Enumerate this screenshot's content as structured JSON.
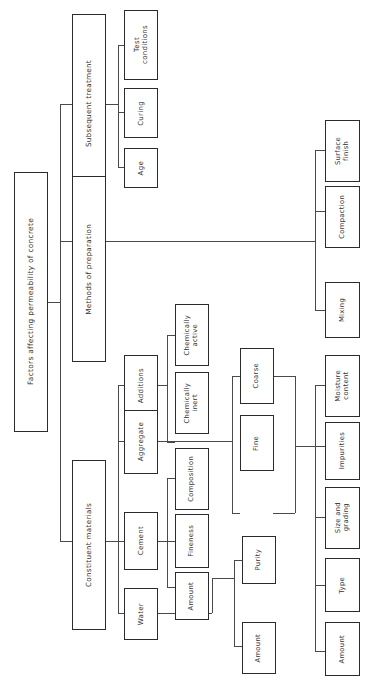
{
  "diagram": {
    "title": "Factors affecting permeability of concrete",
    "orientation": "rotated-90",
    "type": "tree-hierarchy-chart",
    "root": {
      "label": "Factors affecting permeability of concrete"
    },
    "level1": [
      {
        "id": "subsequent-treatment",
        "label": "Subsequent treatment"
      },
      {
        "id": "methods-of-preparation",
        "label": "Methods of preparation"
      },
      {
        "id": "constituent-materials",
        "label": "Constituent materials"
      }
    ],
    "level2": [
      {
        "id": "test-conditions",
        "label": "Test\nconditions"
      },
      {
        "id": "curing",
        "label": "Curing"
      },
      {
        "id": "age",
        "label": "Age"
      },
      {
        "id": "additions",
        "label": "Additions"
      },
      {
        "id": "aggregate",
        "label": "Aggregate"
      },
      {
        "id": "cement",
        "label": "Cement"
      },
      {
        "id": "water",
        "label": "Water"
      }
    ],
    "level3": [
      {
        "id": "chemically-active",
        "label": "Chemically\nactive"
      },
      {
        "id": "chemically-inert",
        "label": "Chemically\ninert"
      },
      {
        "id": "coarse",
        "label": "Coarse"
      },
      {
        "id": "fine",
        "label": "Fine"
      },
      {
        "id": "composition",
        "label": "Composition"
      },
      {
        "id": "fineness",
        "label": "Fineness"
      },
      {
        "id": "cement-amount",
        "label": "Amount"
      },
      {
        "id": "purity",
        "label": "Purity"
      },
      {
        "id": "water-amount",
        "label": "Amount"
      }
    ],
    "level4": [
      {
        "id": "surface-finish",
        "label": "Surface\nfinish"
      },
      {
        "id": "compaction",
        "label": "Compaction"
      },
      {
        "id": "mixing",
        "label": "Mixing"
      },
      {
        "id": "moisture-content",
        "label": "Moisture\ncontent"
      },
      {
        "id": "impurities",
        "label": "Impurities"
      },
      {
        "id": "size-and-grading",
        "label": "Size and\ngrading"
      },
      {
        "id": "type",
        "label": "Type"
      },
      {
        "id": "aggregate-amount",
        "label": "Amount"
      }
    ],
    "colors": {
      "background": "#ffffff",
      "node_border": "#2b2b2b",
      "connector": "#4a4a4a",
      "text": "#333333"
    }
  }
}
